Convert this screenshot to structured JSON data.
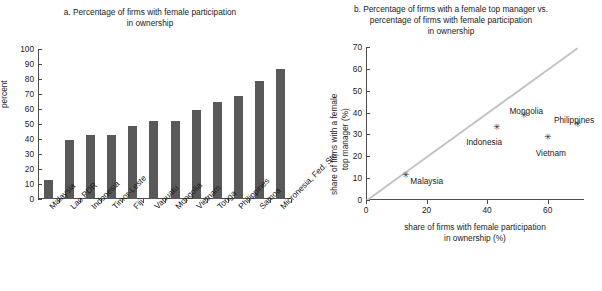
{
  "chart_data": [
    {
      "type": "bar",
      "panel": "a",
      "title_line1": "a. Percentage of firms with female participation",
      "title_line2": "in ownership",
      "ylabel": "percent",
      "xlabel": "",
      "ylim": [
        0,
        100
      ],
      "yticks": [
        0,
        10,
        20,
        30,
        40,
        50,
        60,
        70,
        80,
        90,
        100
      ],
      "grid": false,
      "bar_color": "#595959",
      "categories": [
        "Malaysia",
        "Lao PDR",
        "Indonesia",
        "Timor-Leste",
        "Fiji",
        "Vanuatu",
        "Mongolia",
        "Vietnam",
        "Tonga",
        "Philippines",
        "Samoa",
        "Micronesia, Fed. Sts."
      ],
      "values": [
        12.5,
        39.5,
        43,
        43,
        49,
        52,
        52,
        59.5,
        65,
        69,
        79,
        87
      ]
    },
    {
      "type": "scatter",
      "panel": "b",
      "title_line1": "b. Percentage of firms with a female top manager vs.",
      "title_line2": "percentage of firms with female participation",
      "title_line3": "in ownership",
      "ylabel_line1": "share of firms with a female",
      "ylabel_line2": "top manager (%)",
      "xlabel_line1": "share of firms with female participation",
      "xlabel_line2": "in ownership (%)",
      "xlim": [
        0,
        72
      ],
      "ylim": [
        0,
        70
      ],
      "xticks": [
        0,
        20,
        40,
        60
      ],
      "yticks": [
        0,
        10,
        20,
        30,
        40,
        50,
        60,
        70
      ],
      "grid": false,
      "reference_line": {
        "from": [
          0,
          0
        ],
        "to": [
          70,
          70
        ],
        "color": "#c4c4c4"
      },
      "points": [
        {
          "label": "Malaysia",
          "x": 13,
          "y": 9.0,
          "label_dx": 5,
          "label_dy": -4
        },
        {
          "label": "Indonesia",
          "x": 43,
          "y": 31.0,
          "label_dx": -30,
          "label_dy": 5
        },
        {
          "label": "Mongolia",
          "x": 52,
          "y": 36.5,
          "label_dx": -14,
          "label_dy": -14
        },
        {
          "label": "Vietnam",
          "x": 60,
          "y": 26.5,
          "label_dx": -12,
          "label_dy": 6
        },
        {
          "label": "Philippines",
          "x": 70,
          "y": 32.5,
          "label_dx": -24,
          "label_dy": -14
        }
      ]
    }
  ]
}
